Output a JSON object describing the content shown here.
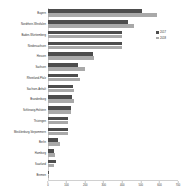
{
  "chart_data": {
    "type": "bar",
    "orientation": "horizontal",
    "title": "",
    "xlabel": "",
    "ylabel": "",
    "grid": false,
    "legend_position": "right",
    "xlim": [
      0,
      700
    ],
    "xticks": [
      0,
      100,
      200,
      300,
      400,
      500,
      600,
      700
    ],
    "xtick_labels": [
      "0",
      "100",
      "200",
      "300",
      "400",
      "500",
      "600",
      "700"
    ],
    "categories": [
      "Bayern",
      "Nordrhein-Westfalen",
      "Baden-Württemberg",
      "Niedersachsen",
      "Hessen",
      "Sachsen",
      "Rheinland-Pfalz",
      "Sachsen-Anhalt",
      "Brandenburg",
      "Schleswig-Holstein",
      "Thüringen",
      "Mecklenburg-Vorpommern",
      "Berlin",
      "Hamburg",
      "Saarland",
      "Bremen"
    ],
    "series": [
      {
        "name": "2017",
        "color": "#4d4d4d",
        "values": [
          505,
          432,
          400,
          400,
          242,
          160,
          160,
          135,
          130,
          122,
          105,
          105,
          55,
          32,
          42,
          8
        ]
      },
      {
        "name": "2018",
        "color": "#a9a9a9",
        "values": [
          585,
          462,
          398,
          398,
          248,
          200,
          170,
          140,
          138,
          125,
          108,
          108,
          62,
          38,
          30,
          6
        ]
      }
    ]
  },
  "legend": {
    "items": [
      {
        "label": "2017",
        "color": "#4d4d4d"
      },
      {
        "label": "2018",
        "color": "#a9a9a9"
      }
    ]
  }
}
